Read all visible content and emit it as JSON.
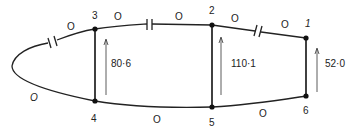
{
  "diagram": {
    "type": "circuit-network",
    "nodes": [
      {
        "id": "1",
        "label": "1",
        "x": 306,
        "y": 38
      },
      {
        "id": "2",
        "label": "2",
        "x": 212,
        "y": 25
      },
      {
        "id": "3",
        "label": "3",
        "x": 95,
        "y": 29
      },
      {
        "id": "4",
        "label": "4",
        "x": 95,
        "y": 101
      },
      {
        "id": "5",
        "label": "5",
        "x": 212,
        "y": 107
      },
      {
        "id": "6",
        "label": "6",
        "x": 306,
        "y": 96
      }
    ],
    "vertical_branches": [
      {
        "from": "4",
        "to": "3",
        "value": "80·6"
      },
      {
        "from": "5",
        "to": "2",
        "value": "110·1"
      },
      {
        "from": "6",
        "to": "1",
        "value": "52·0"
      }
    ],
    "edge_labels": {
      "left_upper": "O",
      "n3_to_cap": "O",
      "cap_to_n2": "O",
      "n2_to_cap": "O",
      "cap_to_n1": "O",
      "left_lower": "O",
      "n4_to_n5": "O",
      "n5_to_n6": "O"
    },
    "capacitors": [
      {
        "position": "left-upper-arc"
      },
      {
        "position": "between-3-and-2"
      },
      {
        "position": "between-2-and-1"
      }
    ]
  }
}
